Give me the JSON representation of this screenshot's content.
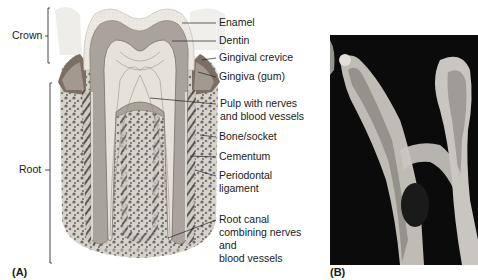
{
  "figure": {
    "panel_a": {
      "tag": "(A)",
      "brackets": [
        {
          "label": "Crown"
        },
        {
          "label": "Root"
        }
      ],
      "labels": [
        {
          "text": "Enamel"
        },
        {
          "text": "Dentin"
        },
        {
          "text": "Gingival crevice"
        },
        {
          "text": "Gingiva (gum)"
        },
        {
          "lines": [
            "Pulp with nerves",
            "and blood vessels"
          ]
        },
        {
          "text": "Bone/socket"
        },
        {
          "text": "Cementum"
        },
        {
          "lines": [
            "Periodontal",
            "ligament"
          ]
        },
        {
          "lines": [
            "Root canal",
            "combining nerves",
            "and",
            "blood vessels"
          ]
        }
      ]
    },
    "panel_b": {
      "tag": "(B)",
      "description": "Radiograph of a molar tooth"
    },
    "colors": {
      "enamel": "#e6e2da",
      "dentin": "#a9a29a",
      "pulp": "#e4e0d8",
      "bone": "#8f8a84",
      "gum": "#6d6259",
      "xray_bg": "#0a0a0a",
      "xray_tooth": "#d8d6d0"
    }
  }
}
